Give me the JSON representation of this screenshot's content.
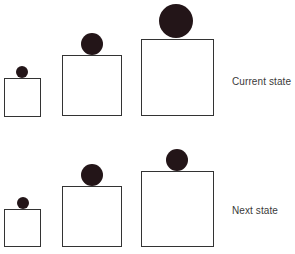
{
  "diagram": {
    "colors": {
      "ball": "#231518",
      "box_stroke": "#333333",
      "label": "#3a3a3a",
      "background": "#ffffff"
    },
    "rows": [
      {
        "label": "Current state",
        "label_pos": {
          "x": 232,
          "y": 76
        },
        "items": [
          {
            "box": {
              "x": 4,
              "y": 78,
              "w": 37,
              "h": 39
            },
            "ball": {
              "cx": 22,
              "cy": 72,
              "r": 6
            }
          },
          {
            "box": {
              "x": 62,
              "y": 55,
              "w": 60,
              "h": 61
            },
            "ball": {
              "cx": 92,
              "cy": 44,
              "r": 11
            }
          },
          {
            "box": {
              "x": 141,
              "y": 39,
              "w": 73,
              "h": 77
            },
            "ball": {
              "cx": 176,
              "cy": 21,
              "r": 17
            }
          }
        ]
      },
      {
        "label": "Next state",
        "label_pos": {
          "x": 232,
          "y": 205
        },
        "items": [
          {
            "box": {
              "x": 4,
              "y": 209,
              "w": 37,
              "h": 38
            },
            "ball": {
              "cx": 23,
              "cy": 203,
              "r": 6
            }
          },
          {
            "box": {
              "x": 62,
              "y": 186,
              "w": 60,
              "h": 61
            },
            "ball": {
              "cx": 92,
              "cy": 175,
              "r": 11
            }
          },
          {
            "box": {
              "x": 141,
              "y": 171,
              "w": 73,
              "h": 76
            },
            "ball": {
              "cx": 177,
              "cy": 160,
              "r": 11
            }
          }
        ]
      }
    ]
  }
}
